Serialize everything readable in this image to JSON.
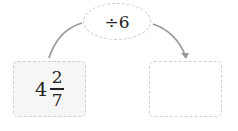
{
  "operation": {
    "label": "÷6"
  },
  "input": {
    "whole": "4",
    "numerator": "2",
    "denominator": "7"
  },
  "output": {
    "value": ""
  },
  "colors": {
    "arrow": "#9a9a9a",
    "dashed_border": "#cccccc",
    "input_fill": "#f6f6f6"
  }
}
